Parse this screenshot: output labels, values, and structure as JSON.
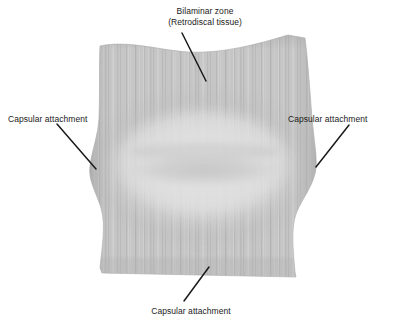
{
  "figure": {
    "background_color": "#ffffff"
  },
  "illustration": {
    "name": "articular-disc-superior-view",
    "description": "Superior view of the temporomandibular joint articular disc showing vertical fibrous striations, a light central oval intermediate zone with a darker transverse band, and bulging lateral poles.",
    "colors": {
      "tissue_base": "#c6c6c6",
      "tissue_light": "#d8d8d8",
      "tissue_edge_shadow": "#a9a9a9",
      "central_oval": "#dcdcdc",
      "central_band": "#c2c2c2",
      "striation": "#b5b5b5",
      "leader_line": "#1a1a1a",
      "label_text": "#1a1a1a"
    }
  },
  "labels": {
    "bilaminar": {
      "text": "Bilaminar zone\n(Retrodiscal tissue)",
      "line1": "Bilaminar zone",
      "line2": "(Retrodiscal tissue)"
    },
    "capsule_left": {
      "text": "Capsular attachment"
    },
    "capsule_right": {
      "text": "Capsular attachment"
    },
    "capsule_bottom": {
      "text": "Capsular attachment"
    }
  },
  "leader_lines": [
    {
      "name": "leader-bilaminar",
      "x1": 182,
      "y1": 33,
      "x2": 206,
      "y2": 81
    },
    {
      "name": "leader-capsule-left",
      "x1": 57,
      "y1": 124,
      "x2": 96,
      "y2": 169
    },
    {
      "name": "leader-capsule-right",
      "x1": 349,
      "y1": 125,
      "x2": 316,
      "y2": 167
    },
    {
      "name": "leader-capsule-bottom",
      "x1": 184,
      "y1": 301,
      "x2": 209,
      "y2": 267
    }
  ]
}
